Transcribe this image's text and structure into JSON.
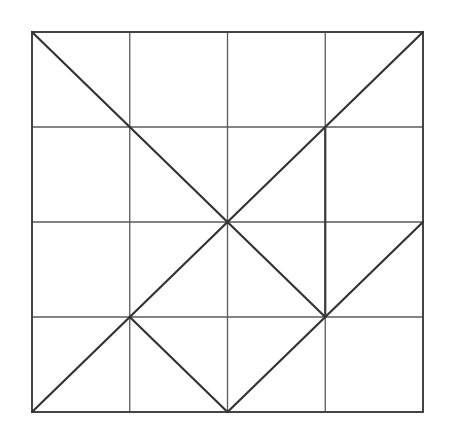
{
  "diagram": {
    "title": "",
    "grid": {
      "rows": 4,
      "cols": 4,
      "origin": [
        32,
        32
      ],
      "cell_width": 97.75,
      "cell_height": 95,
      "line_color": "#5a5a5a",
      "border_color": "#444444"
    },
    "segments": [
      {
        "id": "diag-tl-center",
        "from": [
          0,
          0
        ],
        "to": [
          2,
          2
        ],
        "kind": "diagonal"
      },
      {
        "id": "diag-tr-center",
        "from": [
          4,
          0
        ],
        "to": [
          2,
          2
        ],
        "kind": "diagonal"
      },
      {
        "id": "diag-center-r3c1",
        "from": [
          2,
          2
        ],
        "to": [
          1,
          3
        ],
        "kind": "diagonal"
      },
      {
        "id": "diag-r3c1-bl",
        "from": [
          1,
          3
        ],
        "to": [
          0,
          4
        ],
        "kind": "diagonal"
      },
      {
        "id": "diag-center-r3c3",
        "from": [
          2,
          2
        ],
        "to": [
          3,
          3
        ],
        "kind": "diagonal"
      },
      {
        "id": "diag-r3c1-bottom-mid",
        "from": [
          1,
          3
        ],
        "to": [
          2,
          4
        ],
        "kind": "diagonal"
      },
      {
        "id": "diag-bottom-mid-r3c3",
        "from": [
          2,
          4
        ],
        "to": [
          3,
          3
        ],
        "kind": "diagonal"
      },
      {
        "id": "diag-r3c3-right",
        "from": [
          3,
          3
        ],
        "to": [
          4,
          2
        ],
        "kind": "diagonal"
      },
      {
        "id": "vertical-bold",
        "from": [
          3,
          1
        ],
        "to": [
          3,
          3
        ],
        "kind": "emphasized-vertical"
      }
    ],
    "stroke_color": "#333333"
  }
}
